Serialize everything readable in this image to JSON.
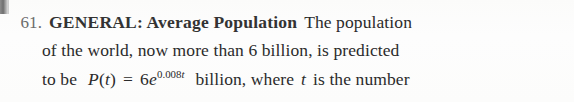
{
  "page": {
    "background_color": "#fdfdfc",
    "text_color": "#2b2b2b",
    "number_color": "#6b6b6b"
  },
  "artifact": {
    "name": "scan-edge-artifact"
  },
  "exercise": {
    "number": "61.",
    "heading": "GENERAL: Average Population",
    "line1_body": "The population",
    "line2": "of the world, now more than 6 billion, is predicted",
    "line3_before_math": "to be",
    "line3_after_math": "billion, where",
    "line3_tail_italic": "t",
    "line3_tail": "is the number",
    "math": {
      "function": "P",
      "open_paren": "(",
      "argument": "t",
      "close_paren": ")",
      "equals": "=",
      "coefficient": "6",
      "base": "e",
      "exponent_coefficient": "0.008",
      "exponent_variable": "t"
    }
  }
}
